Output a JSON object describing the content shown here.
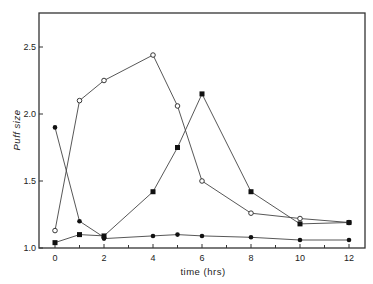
{
  "chart_data": {
    "type": "line",
    "title": "",
    "xlabel": "time (hrs)",
    "ylabel": "Puff size",
    "xlim": [
      -0.6,
      12.7
    ],
    "ylim": [
      1.0,
      2.75
    ],
    "x_ticks_major": [
      0,
      2,
      4,
      6,
      8,
      10,
      12
    ],
    "x_tick_labels": [
      "0",
      "2",
      "4",
      "6",
      "8",
      "10",
      "12"
    ],
    "x_ticks_minor": [
      1,
      3,
      5,
      7,
      9,
      11
    ],
    "y_ticks": [
      1.0,
      1.5,
      2.0,
      2.5
    ],
    "y_tick_labels": [
      "1.0",
      "1.5",
      "2.0",
      "2.5"
    ],
    "grid": false,
    "legend": null,
    "series": [
      {
        "name": "open-circle",
        "marker": "open-circle",
        "x": [
          0,
          1,
          2,
          4,
          5,
          6,
          8,
          10,
          12
        ],
        "values": [
          1.13,
          2.1,
          2.25,
          2.44,
          2.06,
          1.5,
          1.26,
          1.22,
          1.19
        ]
      },
      {
        "name": "filled-square",
        "marker": "filled-square",
        "x": [
          0,
          1,
          2,
          4,
          5,
          6,
          8,
          10,
          12
        ],
        "values": [
          1.04,
          1.1,
          1.09,
          1.42,
          1.75,
          2.15,
          1.42,
          1.18,
          1.19
        ]
      },
      {
        "name": "filled-circle-decline",
        "marker": "filled-circle",
        "x": [
          0,
          1,
          2
        ],
        "values": [
          1.9,
          1.2,
          1.08
        ]
      },
      {
        "name": "filled-circle-baseline",
        "marker": "filled-circle",
        "x": [
          2,
          4,
          5,
          6,
          8,
          10,
          12
        ],
        "values": [
          1.07,
          1.09,
          1.1,
          1.09,
          1.08,
          1.06,
          1.06
        ]
      }
    ]
  },
  "labels": {
    "xlabel": "time (hrs)",
    "ylabel": "Puff size"
  }
}
